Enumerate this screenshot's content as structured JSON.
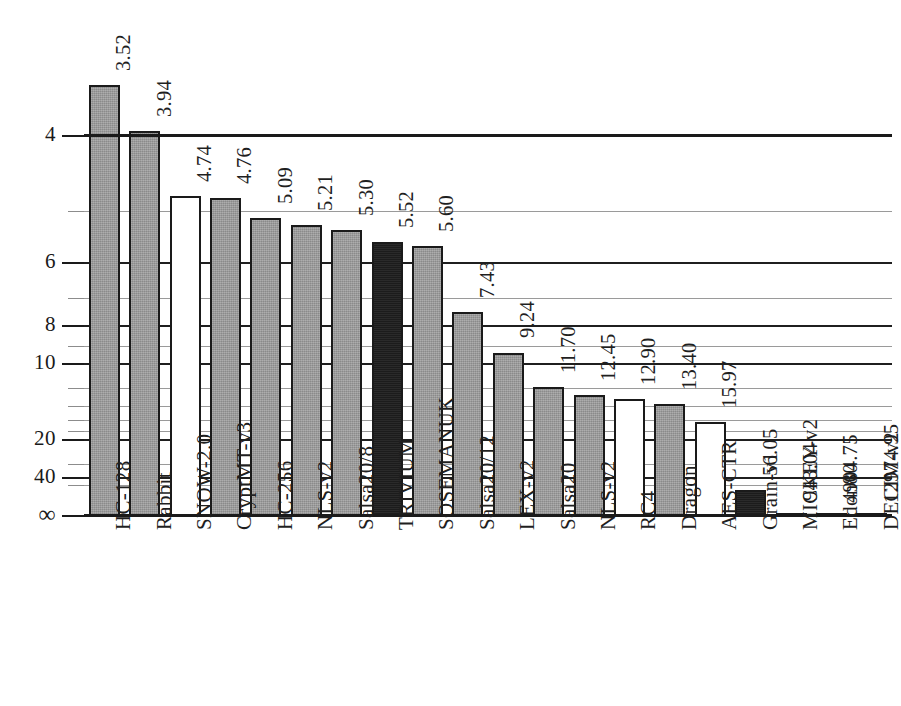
{
  "chart_data": {
    "type": "bar",
    "title": "",
    "subtitle": "",
    "xlabel": "",
    "ylabel": "",
    "grid": true,
    "legend": "none",
    "y_axis": {
      "scale": "reciprocal",
      "tick_labels": [
        "4",
        "6",
        "8",
        "10",
        "20",
        "40",
        "∞"
      ],
      "tick_values": [
        4,
        6,
        8,
        10,
        20,
        40,
        0
      ],
      "minor_tick_values": [
        5,
        7,
        9,
        12,
        14,
        16,
        18,
        30,
        50
      ],
      "ylim_top_value": 4,
      "ylim_bottom_label": "∞",
      "orientation": "inverted-reciprocal",
      "label_rotation_deg": -90
    },
    "x_axis": {
      "label_rotation_deg": -90
    },
    "categories": [
      "HC-128",
      "Rabbit",
      "SNOW-2.0",
      "CryptMT-v3",
      "HC-256",
      "NLS-v2",
      "Salsa20/8",
      "TRIVIUM",
      "SOSEMANUK",
      "Salsa20/12",
      "LEX-v2",
      "Salsa20",
      "NLS-v2",
      "RC4",
      "Dragon",
      "AES-CTR",
      "Grain-v1",
      "MICKEY-v2",
      "Edon80",
      "DECIM-v2"
    ],
    "values": [
      3.52,
      3.94,
      4.74,
      4.76,
      5.09,
      5.21,
      5.3,
      5.52,
      5.6,
      7.43,
      9.24,
      11.7,
      12.45,
      12.9,
      13.4,
      15.97,
      56.05,
      943.04,
      4904.75,
      12974.95
    ],
    "value_labels": [
      "3.52",
      "3.94",
      "4.74",
      "4.76",
      "5.09",
      "5.21",
      "5.30",
      "5.52",
      "5.60",
      "7.43",
      "9.24",
      "11.70",
      "12.45",
      "12.90",
      "13.40",
      "15.97",
      "56.05",
      "943.04",
      "4904.75",
      "12974.95"
    ],
    "bar_styles": [
      "gray",
      "gray",
      "white",
      "gray",
      "gray",
      "gray",
      "gray",
      "black",
      "gray",
      "gray",
      "gray",
      "gray",
      "gray",
      "white",
      "gray",
      "white",
      "black",
      "white",
      "white",
      "white"
    ],
    "colors": {
      "gray": "#9b9b9b",
      "white": "#ffffff",
      "black": "#1f1f1f",
      "outline": "#1a1a1a",
      "gridline_major": "#1f1f1f",
      "gridline_minor": "#9a9a9a",
      "background": "#ffffff"
    }
  }
}
